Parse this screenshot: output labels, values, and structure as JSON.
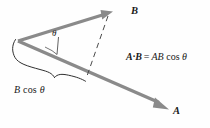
{
  "figure": {
    "background_color": "#fefefe",
    "vector_color": "#8a8a8a",
    "line_color": "#5a5a5a",
    "text_color": "#1a1a1a",
    "labels": {
      "vector_b": "B",
      "vector_a": "A",
      "angle": "θ",
      "projection_prefix": "B",
      "projection_cos": "cos",
      "projection_angle": "θ"
    },
    "equation": {
      "lhs_a": "A",
      "dot": "·",
      "lhs_b": "B",
      "equals": "=",
      "rhs_ab": "AB",
      "rhs_cos": "cos",
      "rhs_angle": "θ"
    },
    "geometry": {
      "origin": [
        18,
        41
      ],
      "vector_b_tip": [
        112,
        12
      ],
      "vector_a_tip": [
        168,
        109
      ],
      "projection_foot": [
        87,
        75
      ],
      "angle_degrees": 28
    }
  }
}
